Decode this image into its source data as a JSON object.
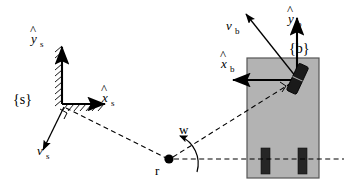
{
  "figure": {
    "background_color": "#ffffff",
    "stroke_color": "#000000",
    "chassis_fill": "#b3b3b3",
    "wheel_fill": "#262626",
    "marker_fill": "#1a1a1a"
  },
  "labels": {
    "y_s": "y",
    "y_s_sub": "s",
    "x_s": "x",
    "x_s_sub": "s",
    "v_s": "v",
    "v_s_sub": "s",
    "frame_s": "{s}",
    "y_b": "y",
    "y_b_sub": "b",
    "x_b": "x",
    "x_b_sub": "b",
    "v_b": "v",
    "v_b_sub": "b",
    "frame_b": "{b}",
    "angle_w": "w",
    "point_r": "r"
  },
  "geometry": {
    "space_frame_origin": [
      62,
      104
    ],
    "body_frame_origin": [
      297,
      78
    ],
    "reference_point": [
      169,
      159
    ],
    "chassis_rect": [
      247,
      58,
      72,
      120
    ],
    "wheel_left": [
      261,
      148,
      9,
      26
    ],
    "wheel_right": [
      298,
      148,
      9,
      26
    ],
    "heading_angle_deg": 25
  }
}
